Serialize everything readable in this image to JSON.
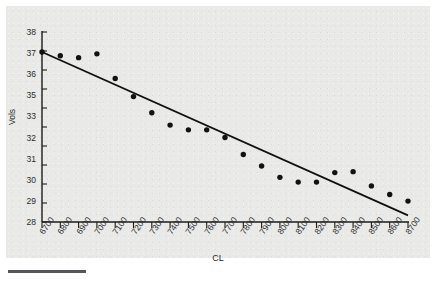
{
  "figure": {
    "xlabel": "CL",
    "ylabel": "Vols",
    "panel_color": "#e9e9e7",
    "point_color": "#121212",
    "line_color": "#101010"
  },
  "chart_data": {
    "type": "scatter",
    "title": "",
    "xlabel": "CL",
    "ylabel": "Vols",
    "xlim": [
      6700,
      8700
    ],
    "ylim": [
      28,
      38
    ],
    "grid": false,
    "legend": null,
    "xticks": [
      6700,
      6800,
      6900,
      7000,
      7100,
      7200,
      7300,
      7400,
      7500,
      7600,
      7700,
      7800,
      7900,
      8000,
      8100,
      8200,
      8300,
      8400,
      8500,
      8600,
      8700
    ],
    "xtick_labels": [
      "6700",
      "6800",
      "6900",
      "7000",
      "7100",
      "7200",
      "7300",
      "7400",
      "7500",
      "7600",
      "7700",
      "7800",
      "7900",
      "8000",
      "8100",
      "8200",
      "8300",
      "8400",
      "8500",
      "8600",
      "8700"
    ],
    "yticks": [
      38,
      37,
      36,
      35,
      34,
      33,
      32,
      31,
      30,
      29,
      28
    ],
    "ytick_labels": [
      "38",
      "37",
      "36",
      "35",
      "33",
      "32",
      "31",
      "30",
      "29",
      "28"
    ],
    "series": [
      {
        "name": "Vols",
        "marker": "circle",
        "x": [
          6700,
          6800,
          6900,
          7000,
          7100,
          7200,
          7300,
          7400,
          7500,
          7600,
          7700,
          7800,
          7900,
          8000,
          8100,
          8200,
          8300,
          8400,
          8500,
          8600,
          8700
        ],
        "y": [
          36.95,
          36.75,
          36.65,
          36.85,
          35.55,
          34.6,
          33.75,
          33.1,
          32.85,
          32.85,
          32.45,
          31.55,
          30.95,
          30.35,
          30.1,
          30.1,
          30.6,
          30.65,
          29.9,
          29.45,
          29.1
        ]
      }
    ],
    "fit_line": {
      "name": "linear fit",
      "x": [
        6700,
        8700
      ],
      "y": [
        36.95,
        28.35
      ]
    }
  }
}
